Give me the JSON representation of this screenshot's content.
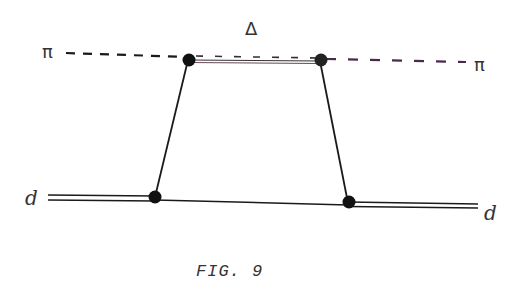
{
  "figure": {
    "caption": "FIG. 9",
    "labels": {
      "pion_in": "π",
      "pion_out": "π",
      "delta": "Δ",
      "deuteron_in": "d",
      "deuteron_out": "d"
    },
    "lines": [
      {
        "name": "pion-line",
        "style": "dashed",
        "from": [
          66,
          52
        ],
        "to": [
          466,
          62
        ]
      },
      {
        "name": "delta-line",
        "style": "double",
        "from": [
          188,
          60
        ],
        "to": [
          320,
          62
        ]
      },
      {
        "name": "deuteron-in-line",
        "style": "double",
        "from": [
          48,
          197
        ],
        "to": [
          155,
          198
        ]
      },
      {
        "name": "nucleon-line",
        "style": "solid",
        "from": [
          155,
          198
        ],
        "to": [
          348,
          203
        ]
      },
      {
        "name": "deuteron-out-line",
        "style": "double",
        "from": [
          348,
          203
        ],
        "to": [
          478,
          207
        ]
      },
      {
        "name": "left-propagator",
        "style": "solid",
        "from": [
          188,
          60
        ],
        "to": [
          155,
          197
        ]
      },
      {
        "name": "right-propagator",
        "style": "solid",
        "from": [
          320,
          61
        ],
        "to": [
          348,
          203
        ]
      }
    ],
    "vertices": [
      {
        "name": "vertex-top-left",
        "x": 188,
        "y": 60
      },
      {
        "name": "vertex-top-right",
        "x": 320,
        "y": 61
      },
      {
        "name": "vertex-bottom-left",
        "x": 155,
        "y": 197
      },
      {
        "name": "vertex-bottom-right",
        "x": 348,
        "y": 203
      }
    ],
    "colors": {
      "ink": "#1a1a1a",
      "tint": "#5a3a5a"
    }
  }
}
